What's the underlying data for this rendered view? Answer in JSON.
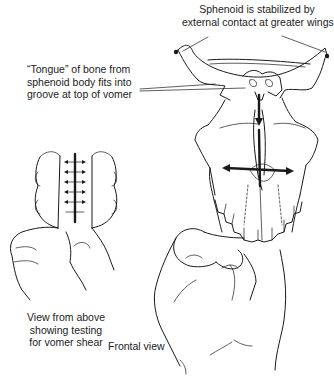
{
  "figure": {
    "type": "medical-line-illustration"
  },
  "labels": {
    "sphenoid": {
      "lines": [
        "Sphenoid is stabilized by",
        "external contact at greater wings"
      ]
    },
    "tongue": {
      "lines": [
        "“Tongue” of bone from",
        "sphenoid body fits into",
        "groove at top of vomer"
      ]
    },
    "above_view": {
      "lines": [
        "View from above",
        "showing testing",
        "for vomer shear"
      ]
    },
    "frontal_view": {
      "text": "Frontal view"
    }
  },
  "colors": {
    "line": "#1a1a1a",
    "background": "#ffffff"
  }
}
